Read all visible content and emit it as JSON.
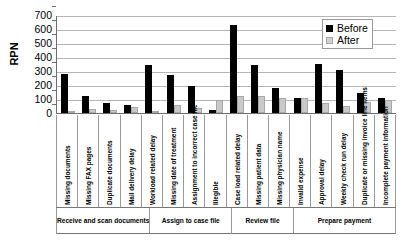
{
  "chart_data": {
    "type": "bar",
    "title": "",
    "xlabel": "",
    "ylabel": "RPN",
    "ylim": [
      0,
      700
    ],
    "ytick_step": 100,
    "yticks": [
      700,
      600,
      500,
      400,
      300,
      200,
      100,
      0
    ],
    "grid": true,
    "legend_position": "top-right",
    "categories": [
      "Missing documents",
      "Missing FAX pages",
      "Duplicate documents",
      "Mail delivery delay",
      "Workload related delay",
      "Missing date of treatment",
      "Assignment to incorrect case file",
      "Illegible",
      "Case load related delay",
      "Missing patient data",
      "Missing physician name",
      "Invalid expense",
      "Approval delay",
      "Weekly check run delay",
      "Duplicate or missing invoice line items",
      "Incomplete payment information"
    ],
    "series": [
      {
        "name": "Before",
        "color": "#000000",
        "values": [
          280,
          125,
          70,
          55,
          345,
          270,
          195,
          20,
          630,
          340,
          180,
          105,
          350,
          310,
          140,
          110
        ]
      },
      {
        "name": "After",
        "color": "#c9c9c9",
        "values": [
          15,
          30,
          20,
          40,
          10,
          55,
          35,
          95,
          125,
          120,
          110,
          105,
          75,
          50,
          80,
          95
        ]
      }
    ],
    "groups": [
      {
        "label": "Receive and scan documents",
        "span": 4
      },
      {
        "label": "Assign to case file",
        "span": 4
      },
      {
        "label": "Review file",
        "span": 3
      },
      {
        "label": "Prepare payment",
        "span": 5
      }
    ]
  },
  "legend": {
    "items": [
      {
        "label": "Before"
      },
      {
        "label": "After"
      }
    ]
  }
}
